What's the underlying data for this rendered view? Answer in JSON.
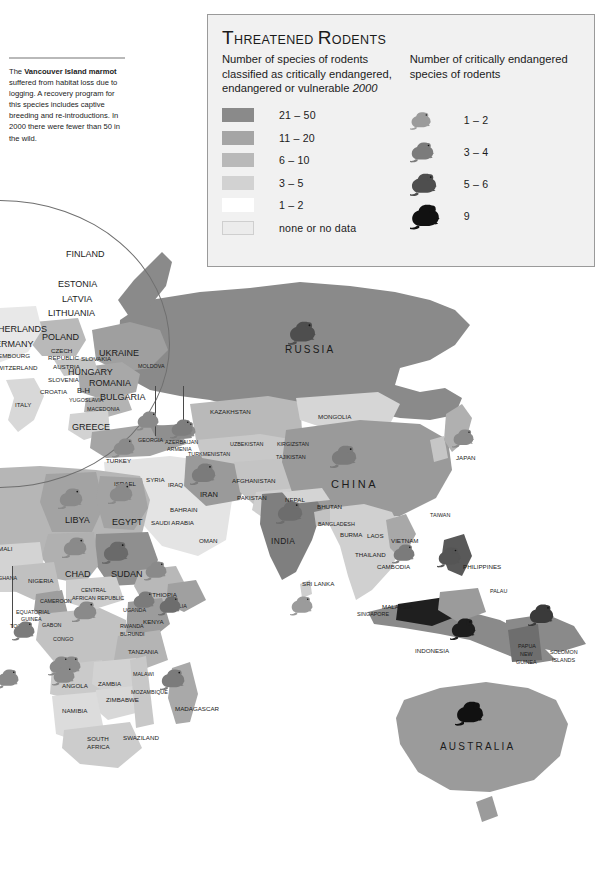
{
  "page": {
    "background": "#ffffff",
    "width": 616,
    "height": 875
  },
  "note": {
    "name": "vancouver-island-marmot-note",
    "text_html": "The Vancouver Island marmot suffered from habitat loss due to logging. A recovery program for this species includes captive breeding and re-introductions. In 2000 there were fewer than 50 in the wild.",
    "bold_phrase": "Vancouver Island marmot"
  },
  "legend": {
    "title": "Threatened Rodents",
    "subtitle_left": "Number of species of rodents classified as critically endangered, endangered or vulnerable",
    "subtitle_left_year": "2000",
    "subtitle_right": "Number of critically endangered species of rodents",
    "choropleth_heading": "Number of species of rodents classified as critically endangered, endangered or vulnerable 2000",
    "classes": [
      {
        "label": "21 – 50",
        "color": "#8a8a8a",
        "bordered": false
      },
      {
        "label": "11 – 20",
        "color": "#a5a5a5",
        "bordered": false
      },
      {
        "label": "6 – 10",
        "color": "#b9b9b9",
        "bordered": false
      },
      {
        "label": "3 – 5",
        "color": "#d2d2d2",
        "bordered": false
      },
      {
        "label": "1 – 2",
        "color": "#ffffff",
        "bordered": false
      },
      {
        "label": "none or no data",
        "color": "#ececec",
        "bordered": true
      }
    ],
    "markers": [
      {
        "label": "1 – 2",
        "color": "#9b9b9b",
        "size": 22
      },
      {
        "label": "3 – 4",
        "color": "#7b7b7b",
        "size": 25
      },
      {
        "label": "5 – 6",
        "color": "#4e4e4e",
        "size": 28
      },
      {
        "label": "9",
        "color": "#111111",
        "size": 31
      }
    ]
  },
  "chart_data": {
    "type": "map",
    "title": "Threatened Rodents",
    "year": "2000",
    "choropleth_legend": [
      "21 – 50",
      "11 – 20",
      "6 – 10",
      "3 – 5",
      "1 – 2",
      "none or no data"
    ],
    "marker_legend": [
      "1 – 2",
      "3 – 4",
      "5 – 6",
      "9"
    ],
    "marker_countries": [
      {
        "country": "RUSSIA",
        "class": "5 – 6"
      },
      {
        "country": "CHINA",
        "class": "3 – 4"
      },
      {
        "country": "INDIA",
        "class": "3 – 4"
      },
      {
        "country": "JAPAN",
        "class": "1 – 2"
      },
      {
        "country": "IRAN",
        "class": "1 – 2"
      },
      {
        "country": "TURKEY",
        "class": "1 – 2"
      },
      {
        "country": "GEORGIA",
        "class": "1 – 2"
      },
      {
        "country": "AZERBAIJAN",
        "class": "1 – 2"
      },
      {
        "country": "KAZAKHSTAN",
        "class": "1 – 2"
      },
      {
        "country": "EGYPT",
        "class": "1 – 2"
      },
      {
        "country": "LIBYA",
        "class": "1 – 2"
      },
      {
        "country": "CHAD",
        "class": "1 – 2"
      },
      {
        "country": "SUDAN",
        "class": "3 – 4"
      },
      {
        "country": "ETHIOPIA",
        "class": "1 – 2"
      },
      {
        "country": "SOMALIA",
        "class": "1 – 2"
      },
      {
        "country": "KENYA",
        "class": "1 – 2"
      },
      {
        "country": "CONGO",
        "class": "1 – 2"
      },
      {
        "country": "TANZANIA",
        "class": "1 – 2"
      },
      {
        "country": "ANGOLA",
        "class": "1 – 2"
      },
      {
        "country": "MADAGASCAR",
        "class": "1 – 2"
      },
      {
        "country": "SRI LANKA",
        "class": "1 – 2"
      },
      {
        "country": "VIETNAM",
        "class": "1 – 2"
      },
      {
        "country": "INDONESIA",
        "class": "5 – 6"
      },
      {
        "country": "PHILIPPINES",
        "class": "3 – 4"
      },
      {
        "country": "PAPUA NEW GUINEA",
        "class": "3 – 4"
      },
      {
        "country": "AUSTRALIA",
        "class": "9"
      }
    ],
    "notes": [
      "The Vancouver Island marmot suffered from habitat loss due to logging. A recovery program for this species includes captive breeding and re-introductions. In 2000 there were fewer than 50 in the wild."
    ]
  },
  "map_labels": [
    {
      "text": "FINLAND",
      "x": 66,
      "y": 250,
      "size": "t9"
    },
    {
      "text": "ESTONIA",
      "x": 58,
      "y": 280,
      "size": "t9"
    },
    {
      "text": "LATVIA",
      "x": 62,
      "y": 295,
      "size": "t9"
    },
    {
      "text": "LITHUANIA",
      "x": 48,
      "y": 309,
      "size": "t9"
    },
    {
      "text": "NETHERLANDS",
      "x": -20,
      "y": 325,
      "size": "t9"
    },
    {
      "text": "POLAND",
      "x": 42,
      "y": 333,
      "size": "t9"
    },
    {
      "text": "GERMANY",
      "x": -12,
      "y": 340,
      "size": "t9"
    },
    {
      "text": "CZECH",
      "x": 51,
      "y": 348,
      "size": "t7"
    },
    {
      "text": "REPUBLIC",
      "x": 48,
      "y": 355,
      "size": "t7"
    },
    {
      "text": "LUXEMBOURG",
      "x": -14,
      "y": 353,
      "size": "t7"
    },
    {
      "text": "SLOVAKIA",
      "x": 81,
      "y": 356,
      "size": "t7"
    },
    {
      "text": "UKRAINE",
      "x": 99,
      "y": 349,
      "size": "t9"
    },
    {
      "text": "MOLDOVA",
      "x": 138,
      "y": 364,
      "size": "t6"
    },
    {
      "text": "AUSTRIA",
      "x": 53,
      "y": 364,
      "size": "t7"
    },
    {
      "text": "SWITZERLAND",
      "x": -7,
      "y": 365,
      "size": "t7"
    },
    {
      "text": "HUNGARY",
      "x": 68,
      "y": 368,
      "size": "t9"
    },
    {
      "text": "SLOVENIA",
      "x": 48,
      "y": 377,
      "size": "t7"
    },
    {
      "text": "ROMANIA",
      "x": 89,
      "y": 379,
      "size": "t9"
    },
    {
      "text": "CROATIA",
      "x": 40,
      "y": 389,
      "size": "t7"
    },
    {
      "text": "B-H",
      "x": 77,
      "y": 387,
      "size": "t8"
    },
    {
      "text": "ITALY",
      "x": 15,
      "y": 402,
      "size": "t7"
    },
    {
      "text": "YUGOSLAVIA",
      "x": 69,
      "y": 398,
      "size": "t6"
    },
    {
      "text": "BULGARIA",
      "x": 100,
      "y": 393,
      "size": "t9"
    },
    {
      "text": "MACEDONIA",
      "x": 87,
      "y": 407,
      "size": "t6"
    },
    {
      "text": "GREECE",
      "x": 72,
      "y": 423,
      "size": "t9"
    },
    {
      "text": "TURKEY",
      "x": 106,
      "y": 458,
      "size": "t7"
    },
    {
      "text": "GEORGIA",
      "x": 138,
      "y": 438,
      "size": "t6"
    },
    {
      "text": "AZERBAIJAN",
      "x": 165,
      "y": 440,
      "size": "t6"
    },
    {
      "text": "ARMENIA",
      "x": 167,
      "y": 447,
      "size": "t6"
    },
    {
      "text": "TURKMENISTAN",
      "x": 188,
      "y": 452,
      "size": "t6"
    },
    {
      "text": "UZBEKISTAN",
      "x": 230,
      "y": 442,
      "size": "t6"
    },
    {
      "text": "KAZAKHSTAN",
      "x": 210,
      "y": 409,
      "size": "t7"
    },
    {
      "text": "KIRGIZSTAN",
      "x": 277,
      "y": 442,
      "size": "t6"
    },
    {
      "text": "TAJIKISTAN",
      "x": 276,
      "y": 455,
      "size": "t6"
    },
    {
      "text": "RUSSIA",
      "x": 285,
      "y": 345,
      "size": "big2"
    },
    {
      "text": "MONGOLIA",
      "x": 318,
      "y": 414,
      "size": "t7"
    },
    {
      "text": "CHINA",
      "x": 331,
      "y": 479,
      "size": "big"
    },
    {
      "text": "JAPAN",
      "x": 456,
      "y": 455,
      "size": "t7"
    },
    {
      "text": "SYRIA",
      "x": 146,
      "y": 477,
      "size": "t7"
    },
    {
      "text": "IRAQ",
      "x": 168,
      "y": 482,
      "size": "t7"
    },
    {
      "text": "ISRAEL",
      "x": 114,
      "y": 481,
      "size": "t7"
    },
    {
      "text": "IRAN",
      "x": 200,
      "y": 491,
      "size": "t8"
    },
    {
      "text": "AFGHANISTAN",
      "x": 232,
      "y": 478,
      "size": "t7"
    },
    {
      "text": "PAKISTAN",
      "x": 237,
      "y": 495,
      "size": "t7"
    },
    {
      "text": "BAHRAIN",
      "x": 170,
      "y": 507,
      "size": "t7"
    },
    {
      "text": "SAUDI ARABIA",
      "x": 151,
      "y": 520,
      "size": "t7"
    },
    {
      "text": "OMAN",
      "x": 199,
      "y": 538,
      "size": "t7"
    },
    {
      "text": "NEPAL",
      "x": 285,
      "y": 497,
      "size": "t7"
    },
    {
      "text": "BHUTAN",
      "x": 317,
      "y": 504,
      "size": "t7"
    },
    {
      "text": "BANGLADESH",
      "x": 318,
      "y": 522,
      "size": "t6"
    },
    {
      "text": "BURMA",
      "x": 340,
      "y": 532,
      "size": "t7"
    },
    {
      "text": "INDIA",
      "x": 271,
      "y": 537,
      "size": "mid"
    },
    {
      "text": "LAOS",
      "x": 367,
      "y": 533,
      "size": "t7"
    },
    {
      "text": "VIETNAM",
      "x": 391,
      "y": 538,
      "size": "t7"
    },
    {
      "text": "THAILAND",
      "x": 355,
      "y": 552,
      "size": "t7"
    },
    {
      "text": "CAMBODIA",
      "x": 377,
      "y": 564,
      "size": "t7"
    },
    {
      "text": "TAIWAN",
      "x": 430,
      "y": 513,
      "size": "t6"
    },
    {
      "text": "SRI LANKA",
      "x": 302,
      "y": 581,
      "size": "t7"
    },
    {
      "text": "MALAYSIA",
      "x": 382,
      "y": 604,
      "size": "t7"
    },
    {
      "text": "SINGAPORE",
      "x": 357,
      "y": 612,
      "size": "t6"
    },
    {
      "text": "PHILIPPINES",
      "x": 463,
      "y": 564,
      "size": "t7"
    },
    {
      "text": "PALAU",
      "x": 490,
      "y": 589,
      "size": "t6"
    },
    {
      "text": "INDONESIA",
      "x": 415,
      "y": 648,
      "size": "t7"
    },
    {
      "text": "PAPUA",
      "x": 518,
      "y": 644,
      "size": "t6"
    },
    {
      "text": "NEW",
      "x": 520,
      "y": 652,
      "size": "t6"
    },
    {
      "text": "GUINEA",
      "x": 516,
      "y": 660,
      "size": "t6"
    },
    {
      "text": "SOLOMON",
      "x": 550,
      "y": 650,
      "size": "t6"
    },
    {
      "text": "ISLANDS",
      "x": 552,
      "y": 658,
      "size": "t6"
    },
    {
      "text": "AUSTRALIA",
      "x": 440,
      "y": 742,
      "size": "big2"
    },
    {
      "text": "LIBYA",
      "x": 65,
      "y": 516,
      "size": "t9"
    },
    {
      "text": "EGYPT",
      "x": 112,
      "y": 518,
      "size": "t9"
    },
    {
      "text": "MALI",
      "x": -2,
      "y": 546,
      "size": "t7"
    },
    {
      "text": "CHAD",
      "x": 65,
      "y": 570,
      "size": "t9"
    },
    {
      "text": "SUDAN",
      "x": 111,
      "y": 570,
      "size": "t9"
    },
    {
      "text": "NIGERIA",
      "x": 28,
      "y": 578,
      "size": "t7"
    },
    {
      "text": "CENTRAL",
      "x": 81,
      "y": 588,
      "size": "t6"
    },
    {
      "text": "AFRICAN REPUBLIC",
      "x": 72,
      "y": 596,
      "size": "t6"
    },
    {
      "text": "ETHIOPIA",
      "x": 148,
      "y": 592,
      "size": "t7"
    },
    {
      "text": "CAMEROON",
      "x": 40,
      "y": 599,
      "size": "t6"
    },
    {
      "text": "EQUATORIAL",
      "x": 16,
      "y": 610,
      "size": "t6"
    },
    {
      "text": "GUINEA",
      "x": 21,
      "y": 617,
      "size": "t6"
    },
    {
      "text": "UGANDA",
      "x": 123,
      "y": 608,
      "size": "t6"
    },
    {
      "text": "SOMALIA",
      "x": 163,
      "y": 604,
      "size": "t6"
    },
    {
      "text": "KENYA",
      "x": 143,
      "y": 619,
      "size": "t7"
    },
    {
      "text": "TOGO",
      "x": 10,
      "y": 624,
      "size": "t6"
    },
    {
      "text": "GABON",
      "x": 42,
      "y": 623,
      "size": "t6"
    },
    {
      "text": "RWANDA",
      "x": 120,
      "y": 624,
      "size": "t6"
    },
    {
      "text": "BURUNDI",
      "x": 120,
      "y": 632,
      "size": "t6"
    },
    {
      "text": "CONGO",
      "x": 53,
      "y": 637,
      "size": "t6"
    },
    {
      "text": "GHANA",
      "x": -2,
      "y": 576,
      "size": "t6"
    },
    {
      "text": "TANZANIA",
      "x": 128,
      "y": 649,
      "size": "t7"
    },
    {
      "text": "ANGOLA",
      "x": 62,
      "y": 683,
      "size": "t7"
    },
    {
      "text": "ZAMBIA",
      "x": 98,
      "y": 681,
      "size": "t7"
    },
    {
      "text": "MALAWI",
      "x": 133,
      "y": 672,
      "size": "t6"
    },
    {
      "text": "ZIMBABWE",
      "x": 106,
      "y": 697,
      "size": "t7"
    },
    {
      "text": "NAMIBIA",
      "x": 62,
      "y": 708,
      "size": "t7"
    },
    {
      "text": "MOZAMBIQUE",
      "x": 131,
      "y": 690,
      "size": "t6"
    },
    {
      "text": "MADAGASCAR",
      "x": 175,
      "y": 706,
      "size": "t7"
    },
    {
      "text": "SOUTH",
      "x": 87,
      "y": 736,
      "size": "t7"
    },
    {
      "text": "AFRICA",
      "x": 87,
      "y": 744,
      "size": "t7"
    },
    {
      "text": "SWAZILAND",
      "x": 123,
      "y": 735,
      "size": "t7"
    }
  ],
  "map_mice": [
    {
      "name": "mouse-russia",
      "x": 288,
      "y": 320,
      "size": 29,
      "color": "#4e4e4e"
    },
    {
      "name": "mouse-kazakhstan",
      "x": 173,
      "y": 420,
      "size": 24,
      "color": "#8a8a8a"
    },
    {
      "name": "mouse-georgia",
      "x": 136,
      "y": 410,
      "size": 24,
      "color": "#8a8a8a"
    },
    {
      "name": "mouse-azerbaijan",
      "x": 170,
      "y": 418,
      "size": 24,
      "color": "#7e7e7e"
    },
    {
      "name": "mouse-turkey",
      "x": 112,
      "y": 437,
      "size": 24,
      "color": "#8a8a8a"
    },
    {
      "name": "mouse-iran",
      "x": 190,
      "y": 462,
      "size": 27,
      "color": "#7b7b7b"
    },
    {
      "name": "mouse-japan",
      "x": 452,
      "y": 428,
      "size": 23,
      "color": "#8a8a8a"
    },
    {
      "name": "mouse-china",
      "x": 330,
      "y": 444,
      "size": 28,
      "color": "#7b7b7b"
    },
    {
      "name": "mouse-india",
      "x": 276,
      "y": 500,
      "size": 28,
      "color": "#6d6d6d"
    },
    {
      "name": "mouse-egypt",
      "x": 108,
      "y": 482,
      "size": 26,
      "color": "#8a8a8a"
    },
    {
      "name": "mouse-libya",
      "x": 58,
      "y": 487,
      "size": 26,
      "color": "#8a8a8a"
    },
    {
      "name": "mouse-chad",
      "x": 62,
      "y": 536,
      "size": 26,
      "color": "#8a8a8a"
    },
    {
      "name": "mouse-sudan",
      "x": 102,
      "y": 540,
      "size": 28,
      "color": "#6a6a6a"
    },
    {
      "name": "mouse-ethiopia",
      "x": 144,
      "y": 560,
      "size": 24,
      "color": "#8a8a8a"
    },
    {
      "name": "mouse-somalia",
      "x": 158,
      "y": 595,
      "size": 24,
      "color": "#6d6d6d"
    },
    {
      "name": "mouse-kenya",
      "x": 132,
      "y": 590,
      "size": 24,
      "color": "#7b7b7b"
    },
    {
      "name": "mouse-congo",
      "x": 72,
      "y": 600,
      "size": 26,
      "color": "#8a8a8a"
    },
    {
      "name": "mouse-ghana",
      "x": 12,
      "y": 620,
      "size": 24,
      "color": "#7b7b7b"
    },
    {
      "name": "mouse-gabon",
      "x": 58,
      "y": 655,
      "size": 24,
      "color": "#8a8a8a"
    },
    {
      "name": "mouse-tanzania",
      "x": -4,
      "y": 668,
      "size": 24,
      "color": "#8a8a8a"
    },
    {
      "name": "mouse-angola",
      "x": 48,
      "y": 655,
      "size": 24,
      "color": "#8a8a8a"
    },
    {
      "name": "mouse-zambia",
      "x": 52,
      "y": 665,
      "size": 24,
      "color": "#8a8a8a"
    },
    {
      "name": "mouse-madagascar",
      "x": 160,
      "y": 668,
      "size": 26,
      "color": "#7b7b7b"
    },
    {
      "name": "mouse-srilanka",
      "x": 290,
      "y": 595,
      "size": 24,
      "color": "#9b9b9b"
    },
    {
      "name": "mouse-vietnam",
      "x": 392,
      "y": 543,
      "size": 24,
      "color": "#7b7b7b"
    },
    {
      "name": "mouse-philippines",
      "x": 437,
      "y": 546,
      "size": 25,
      "color": "#555555"
    },
    {
      "name": "mouse-indonesia",
      "x": 450,
      "y": 617,
      "size": 27,
      "color": "#1d1d1d"
    },
    {
      "name": "mouse-png",
      "x": 528,
      "y": 603,
      "size": 27,
      "color": "#3a3a3a"
    },
    {
      "name": "mouse-australia",
      "x": 455,
      "y": 700,
      "size": 30,
      "color": "#111111"
    }
  ]
}
